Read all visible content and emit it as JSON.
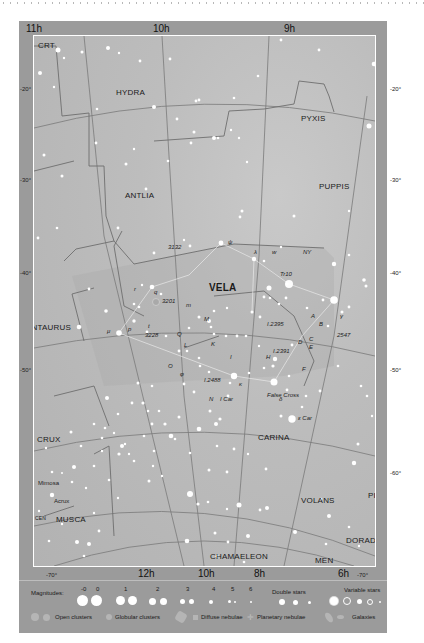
{
  "chart_title": "Star chart: Vela and surrounding constellations",
  "ra_labels_top": [
    "11h",
    "10h",
    "9h"
  ],
  "ra_labels_bottom": [
    "12h",
    "10h",
    "8h",
    "6h"
  ],
  "dec_labels_left": [
    "-20°",
    "-30°",
    "-40°",
    "-50°",
    "-60°",
    "-70°"
  ],
  "dec_labels_right": [
    "-20°",
    "-30°",
    "-40°",
    "-50°",
    "-60°",
    "-70°"
  ],
  "constellations": {
    "crt": "CRT",
    "hydra": "HYDRA",
    "pyxis": "PYXIS",
    "antlia": "ANTLIA",
    "puppis": "PUPPIS",
    "vela": "VELA",
    "centaurus": "CENTAURUS",
    "carina": "CARINA",
    "crux": "CRUX",
    "volans": "VOLANS",
    "pic": "PIC",
    "dorado": "DORADO",
    "musca": "MUSCA",
    "cen": "CEN",
    "chamaeleon": "CHAMAELEON",
    "men": "MEN"
  },
  "named_stars": {
    "mimosa": "Mimosa",
    "acrux": "Acrux",
    "false_cross": "False Cross",
    "eps_car": "ε Car",
    "i_car": "I Car"
  },
  "deep_sky_labels": [
    "3132",
    "3201",
    "3228",
    "2547",
    "Tr10",
    "NY",
    "I.2395",
    "I.2391",
    "I.2488"
  ],
  "greek_letters": {
    "psi": "ψ",
    "lambda": "λ",
    "mu": "μ",
    "gamma": "γ",
    "delta": "δ",
    "kappa": "κ",
    "phi": "φ",
    "q": "q",
    "r": "r",
    "p": "p",
    "s": "s",
    "t": "t",
    "m": "m",
    "u": "u",
    "w": "w",
    "d": "d",
    "e": "e",
    "c": "c",
    "b": "b",
    "f": "f",
    "a": "a",
    "o": "o",
    "h": "h",
    "i": "i",
    "x": "x",
    "y": "y",
    "j": "J"
  },
  "letter_labels": [
    "M",
    "L",
    "K",
    "O",
    "Q",
    "A",
    "B",
    "C",
    "D",
    "E",
    "F",
    "G",
    "H",
    "N",
    "J",
    "I"
  ],
  "legend": {
    "magnitudes_label": "Magnitudes:",
    "magnitudes": [
      "-0",
      "0",
      "1",
      "2",
      "3",
      "4",
      "5",
      "6"
    ],
    "double_stars": "Double stars",
    "variable_stars": "Variable stars",
    "open_clusters": "Open clusters",
    "globular_clusters": "Globular clusters",
    "diffuse_nebulae": "Diffuse nebulae",
    "planetary_nebulae": "Planetary nebulae",
    "galaxies": "Galaxies"
  },
  "colors": {
    "frame": "#9b9b9b",
    "sky": "#bdbdbd",
    "boundary": "#6e6e6e",
    "star": "#ffffff"
  }
}
